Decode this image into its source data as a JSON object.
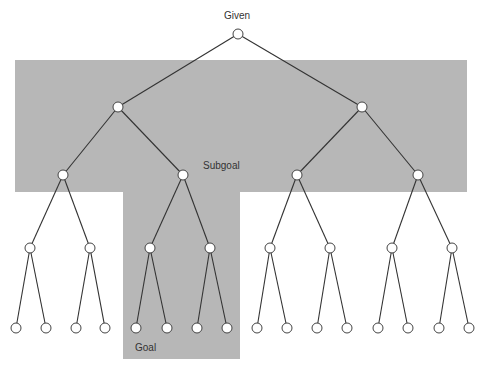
{
  "labels": {
    "root": "Given",
    "subgoal": "Subgoal",
    "goal": "Goal"
  },
  "colors": {
    "shade": "#b7b7b7",
    "edge": "#333333",
    "node_fill": "#ffffff"
  },
  "tree": {
    "levels": 5,
    "branching_factor": 2,
    "nodes": [
      {
        "id": "n0",
        "x": 238,
        "y": 34
      },
      {
        "id": "n1",
        "x": 118,
        "y": 107
      },
      {
        "id": "n2",
        "x": 362,
        "y": 107
      },
      {
        "id": "n3",
        "x": 63,
        "y": 175
      },
      {
        "id": "n4",
        "x": 183,
        "y": 175
      },
      {
        "id": "n5",
        "x": 297,
        "y": 175
      },
      {
        "id": "n6",
        "x": 418,
        "y": 175
      },
      {
        "id": "n7",
        "x": 30,
        "y": 248
      },
      {
        "id": "n8",
        "x": 90,
        "y": 248
      },
      {
        "id": "n9",
        "x": 150,
        "y": 248
      },
      {
        "id": "n10",
        "x": 210,
        "y": 248
      },
      {
        "id": "n11",
        "x": 270,
        "y": 248
      },
      {
        "id": "n12",
        "x": 330,
        "y": 248
      },
      {
        "id": "n13",
        "x": 392,
        "y": 248
      },
      {
        "id": "n14",
        "x": 452,
        "y": 248
      },
      {
        "id": "n15",
        "x": 16,
        "y": 328
      },
      {
        "id": "n16",
        "x": 46,
        "y": 328
      },
      {
        "id": "n17",
        "x": 76,
        "y": 328
      },
      {
        "id": "n18",
        "x": 105,
        "y": 328
      },
      {
        "id": "n19",
        "x": 136,
        "y": 328
      },
      {
        "id": "n20",
        "x": 167,
        "y": 328
      },
      {
        "id": "n21",
        "x": 197,
        "y": 328
      },
      {
        "id": "n22",
        "x": 227,
        "y": 328
      },
      {
        "id": "n23",
        "x": 257,
        "y": 328
      },
      {
        "id": "n24",
        "x": 287,
        "y": 328
      },
      {
        "id": "n25",
        "x": 317,
        "y": 328
      },
      {
        "id": "n26",
        "x": 347,
        "y": 328
      },
      {
        "id": "n27",
        "x": 378,
        "y": 328
      },
      {
        "id": "n28",
        "x": 408,
        "y": 328
      },
      {
        "id": "n29",
        "x": 439,
        "y": 328
      },
      {
        "id": "n30",
        "x": 469,
        "y": 328
      }
    ]
  }
}
